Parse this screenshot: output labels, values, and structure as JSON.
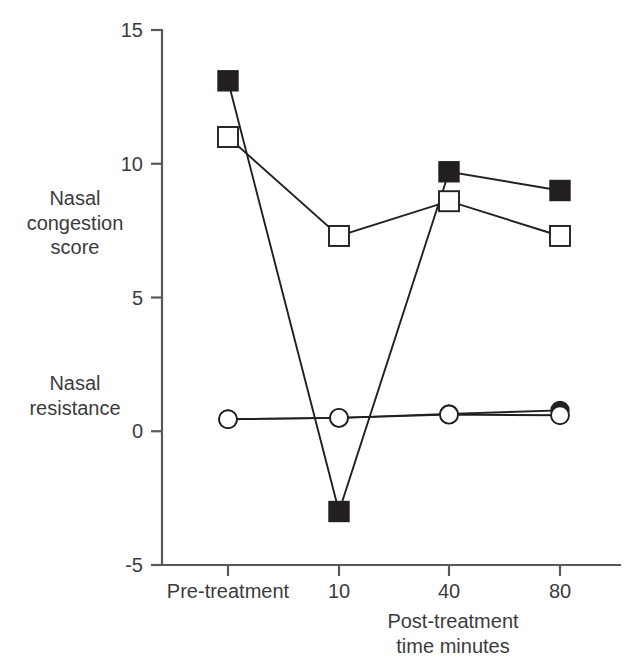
{
  "chart_data": {
    "type": "line",
    "title": "",
    "xlabel": "Post-treatment\ntime minutes",
    "ylabel": "",
    "y_axis_titles": [
      "Nasal\ncongestion\nscore",
      "Nasal\nresistance"
    ],
    "categories": [
      "Pre-treatment",
      "10",
      "40",
      "80"
    ],
    "xticklabels": [
      "Pre-treatment",
      "10",
      "40",
      "80"
    ],
    "yticklabels": [
      "15",
      "10",
      "5",
      "0",
      "-5"
    ],
    "ytickvalues": [
      15,
      10,
      5,
      0,
      -5
    ],
    "ylim": [
      -5,
      15
    ],
    "grid": false,
    "legend": "none",
    "series": [
      {
        "name": "Nasal congestion score - filled",
        "marker": "filled-square",
        "values": [
          13.1,
          -3.0,
          9.7,
          9.0
        ]
      },
      {
        "name": "Nasal congestion score - open",
        "marker": "open-square",
        "values": [
          11.0,
          7.3,
          8.6,
          7.3
        ]
      },
      {
        "name": "Nasal resistance - filled",
        "marker": "filled-circle",
        "values": [
          0.45,
          0.5,
          0.65,
          0.78
        ]
      },
      {
        "name": "Nasal resistance - open",
        "marker": "open-circle",
        "values": [
          0.45,
          0.5,
          0.62,
          0.6
        ]
      }
    ]
  },
  "colors": {
    "ink": "#231f20",
    "axis": "#58595b",
    "text": "#3b3b3d",
    "background": "#ffffff"
  }
}
